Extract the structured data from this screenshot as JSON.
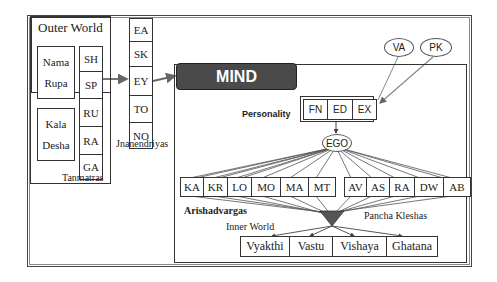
{
  "outer_world": {
    "title": "Outer World",
    "nama_rupa": [
      "Nama",
      "Rupa"
    ],
    "kala_desha": [
      "Kala",
      "Desha"
    ],
    "tanmatras": [
      "SH",
      "SP",
      "RU",
      "RA",
      "GA"
    ],
    "tanmatras_label": "Tanmatras"
  },
  "jnanendriyas": {
    "items": [
      "EA",
      "SK",
      "EY",
      "TO",
      "NO"
    ],
    "label": "Jnanendriyas"
  },
  "mind": {
    "title": "MIND",
    "influences": [
      "VA",
      "PK"
    ],
    "personality_label": "Personality",
    "personality": [
      "FN",
      "ED",
      "EX"
    ],
    "ego": "EGO",
    "arishadvargas": [
      "KA",
      "KR",
      "LO",
      "MO",
      "MA",
      "MT"
    ],
    "arishadvargas_label": "Arishadvargas",
    "pancha_kleshas": [
      "AV",
      "AS",
      "RA",
      "DW",
      "AB"
    ],
    "pancha_kleshas_label": "Pancha Kleshas",
    "inner_world_label": "Inner World",
    "inner_world": [
      "Vyakthi",
      "Vastu",
      "Vishaya",
      "Ghatana"
    ]
  },
  "colors": {
    "mind_header_bg": "#4a4a4a",
    "arrow": "#666666",
    "funnel": "#555555"
  }
}
